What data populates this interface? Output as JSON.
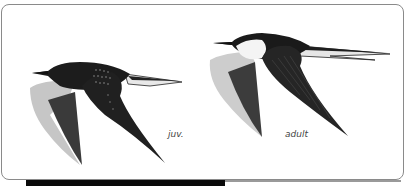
{
  "figure": {
    "labels": {
      "juvenile": "juv.",
      "adult": "adult"
    },
    "colors": {
      "background": "#ffffff",
      "frame_border": "#8a8a8a",
      "bird_dark": "#1a1a1a",
      "bird_mid": "#555555",
      "wing_pale": "#c8c8c8",
      "breast_white": "#f2f2f2"
    }
  }
}
